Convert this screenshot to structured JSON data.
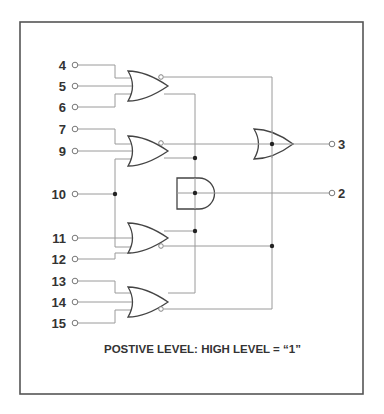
{
  "diagram": {
    "inputs": [
      {
        "label": "4",
        "y": 65
      },
      {
        "label": "5",
        "y": 86
      },
      {
        "label": "6",
        "y": 107
      },
      {
        "label": "7",
        "y": 129
      },
      {
        "label": "9",
        "y": 151
      },
      {
        "label": "10",
        "y": 194
      },
      {
        "label": "11",
        "y": 238
      },
      {
        "label": "12",
        "y": 259
      },
      {
        "label": "13",
        "y": 281
      },
      {
        "label": "14",
        "y": 302
      },
      {
        "label": "15",
        "y": 323
      }
    ],
    "outputs": [
      {
        "label": "3",
        "y": 144
      },
      {
        "label": "2",
        "y": 193
      }
    ],
    "gates": [
      {
        "id": "or-1",
        "type": "OR",
        "inputs": [
          "4",
          "5",
          "6"
        ]
      },
      {
        "id": "or-2",
        "type": "OR",
        "inputs": [
          "7",
          "9",
          "10"
        ]
      },
      {
        "id": "or-3",
        "type": "OR",
        "inputs": [
          "10",
          "11",
          "12"
        ]
      },
      {
        "id": "or-4",
        "type": "OR",
        "inputs": [
          "13",
          "14",
          "15"
        ]
      },
      {
        "id": "and-out",
        "type": "AND",
        "output": "2"
      },
      {
        "id": "or-out",
        "type": "OR",
        "output": "3"
      }
    ],
    "caption": "POSTIVE LEVEL: HIGH LEVEL = “1”"
  },
  "colors": {
    "frame": "#555555",
    "wire": "#9a9a9a",
    "gate": "#444444",
    "text": "#333333"
  }
}
